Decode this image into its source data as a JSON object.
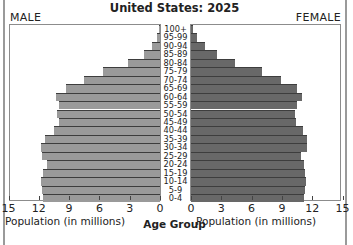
{
  "title": "United States: 2025",
  "labels": {
    "male": "MALE",
    "female": "FEMALE",
    "x_axis_left": "Population (in millions)",
    "x_axis_right": "Population (in millions)",
    "center_axis": "Age Group"
  },
  "colors": {
    "male_bar": "#9a9a9a",
    "female_bar": "#686868",
    "bar_border": "#3d3d3d",
    "frame": "#8c8c8c"
  },
  "ticks": {
    "left": [
      "15",
      "12",
      "9",
      "6",
      "3",
      "0"
    ],
    "right": [
      "0",
      "3",
      "6",
      "9",
      "12",
      "15"
    ]
  },
  "chart_data": {
    "type": "bar",
    "subtype": "population-pyramid",
    "title": "United States: 2025",
    "xlabel": "Population (in millions)",
    "ylabel": "Age Group",
    "xlim": [
      0,
      15
    ],
    "legend": [
      "MALE",
      "FEMALE"
    ],
    "categories": [
      "100+",
      "95-99",
      "90-94",
      "85-89",
      "80-84",
      "75-79",
      "70-74",
      "65-69",
      "60-64",
      "55-59",
      "50-54",
      "45-49",
      "40-44",
      "35-39",
      "30-34",
      "25-29",
      "20-24",
      "15-19",
      "10-14",
      "5-9",
      "0-4"
    ],
    "series": [
      {
        "name": "MALE",
        "values": [
          0.1,
          0.3,
          0.8,
          1.6,
          3.2,
          5.6,
          7.5,
          9.3,
          10.3,
          10.0,
          10.2,
          10.0,
          10.5,
          11.4,
          11.8,
          11.7,
          11.2,
          11.6,
          11.8,
          11.7,
          11.6
        ]
      },
      {
        "name": "FEMALE",
        "values": [
          0.2,
          0.6,
          1.4,
          2.6,
          4.4,
          7.0,
          8.9,
          10.5,
          11.0,
          10.5,
          10.3,
          10.4,
          11.1,
          11.5,
          11.5,
          10.9,
          11.2,
          11.3,
          11.4,
          11.3,
          11.2
        ]
      }
    ]
  }
}
